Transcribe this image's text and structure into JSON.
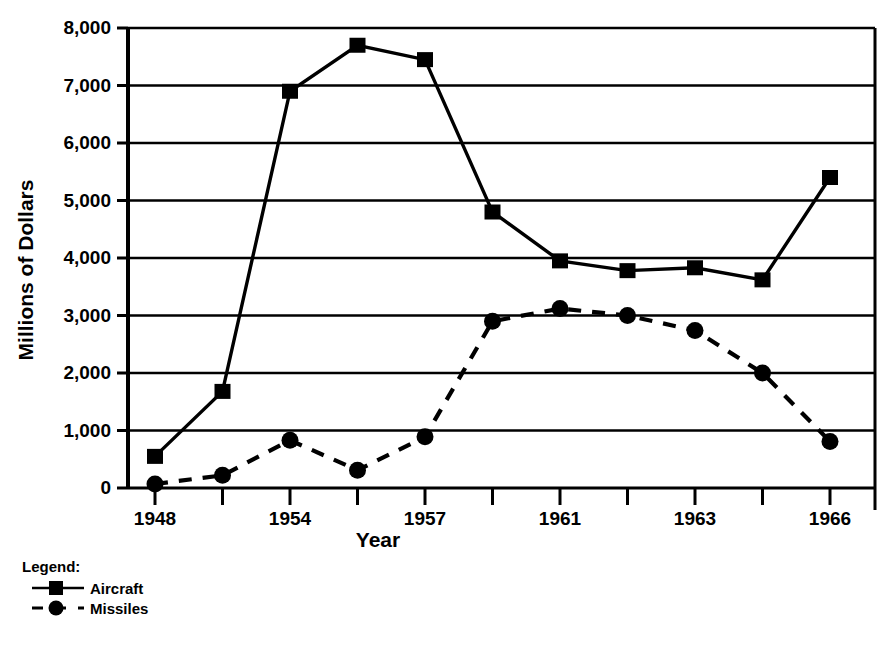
{
  "chart_data": {
    "type": "line",
    "title": "",
    "xlabel": "Year",
    "ylabel": "Millions of Dollars",
    "xlim": [
      1948,
      1966
    ],
    "ylim": [
      0,
      8000
    ],
    "grid": true,
    "legend_position": "below-left",
    "legend_title": "Legend:",
    "x": [
      1948,
      1951,
      1954,
      1955,
      1957,
      1959,
      1961,
      1962,
      1963,
      1964,
      1966
    ],
    "x_tick_labels": [
      "1948",
      "",
      "1954",
      "",
      "1957",
      "",
      "1961",
      "",
      "1963",
      "",
      "1966",
      ""
    ],
    "y_tick_labels": [
      "0",
      "1,000",
      "2,000",
      "3,000",
      "4,000",
      "5,000",
      "6,000",
      "7,000",
      "8,000"
    ],
    "y_tick_values": [
      0,
      1000,
      2000,
      3000,
      4000,
      5000,
      6000,
      7000,
      8000
    ],
    "series": [
      {
        "name": "Aircraft",
        "marker": "square",
        "linestyle": "solid",
        "color": "#000000",
        "values": [
          550,
          1680,
          6900,
          7700,
          7450,
          4800,
          3950,
          3780,
          3830,
          3620,
          5400
        ]
      },
      {
        "name": "Missiles",
        "marker": "circle",
        "linestyle": "dashed",
        "color": "#000000",
        "values": [
          70,
          220,
          830,
          310,
          890,
          2900,
          3120,
          3000,
          2740,
          2000,
          810
        ]
      }
    ]
  },
  "axes": {
    "y_title": "Millions of Dollars",
    "x_title": "Year"
  },
  "legend": {
    "heading": "Legend:",
    "items": [
      {
        "label": "Aircraft",
        "marker": "square-marker",
        "line": "solid-line"
      },
      {
        "label": "Missiles",
        "marker": "circle-marker",
        "line": "dashed-line"
      }
    ]
  }
}
